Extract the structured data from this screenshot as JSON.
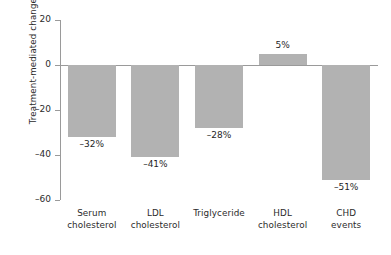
{
  "chart_data": {
    "type": "bar",
    "title": "",
    "xlabel": "",
    "ylabel": "Treatment-mediated change (%)",
    "ylim": [
      -60,
      20
    ],
    "yticks": [
      20,
      0,
      -20,
      -40,
      -60
    ],
    "ytick_labels": [
      "20",
      "0",
      "–20",
      "–40",
      "–60"
    ],
    "grid": false,
    "legend": false,
    "bar_color": "#b2b2b2",
    "axis_color": "#9a9a9a",
    "categories": [
      "Serum cholesterol",
      "LDL cholesterol",
      "Triglyceride",
      "HDL cholesterol",
      "CHD events"
    ],
    "category_lines": [
      [
        "Serum",
        "cholesterol"
      ],
      [
        "LDL",
        "cholesterol"
      ],
      [
        "Triglyceride",
        ""
      ],
      [
        "HDL",
        "cholesterol"
      ],
      [
        "CHD",
        "events"
      ]
    ],
    "values": [
      -32,
      -41,
      -28,
      5,
      -51
    ],
    "data_labels": [
      "–32%",
      "–41%",
      "–28%",
      "5%",
      "–51%"
    ]
  }
}
